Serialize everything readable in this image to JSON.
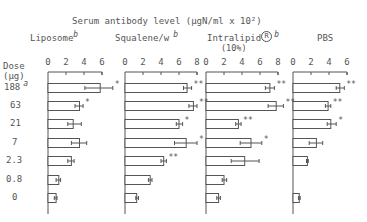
{
  "chart_data": {
    "type": "bar",
    "orientation": "horizontal",
    "title": "Serum antibody level (µgN/ml x 10²)",
    "ylabel": "Dose (µg)",
    "categories": [
      "188",
      "63",
      "21",
      "7",
      "2.3",
      "0.8",
      "0"
    ],
    "category_footnote": {
      "188": "a"
    },
    "error_bars": true,
    "grid": false,
    "panels": [
      {
        "name": "Liposome",
        "footnote": "b",
        "xlim": [
          0,
          6
        ],
        "ticks": [
          0,
          2,
          4,
          6
        ],
        "values": [
          5.8,
          3.5,
          2.8,
          3.5,
          2.6,
          1.2,
          0.9
        ],
        "err_low": [
          4.1,
          3.0,
          2.2,
          2.6,
          2.2,
          0.9,
          0.7
        ],
        "err_high": [
          7.2,
          3.9,
          3.7,
          4.3,
          2.9,
          1.4,
          1.0
        ],
        "significance": [
          "*",
          "*",
          "",
          "",
          "",
          "",
          ""
        ]
      },
      {
        "name": "Squalene/w",
        "footnote": "b",
        "xlim": [
          0,
          8
        ],
        "ticks": [
          0,
          2,
          4,
          6,
          8
        ],
        "values": [
          6.9,
          7.6,
          6.0,
          6.8,
          4.3,
          2.8,
          1.3
        ],
        "err_low": [
          6.5,
          7.1,
          5.7,
          5.5,
          4.0,
          2.6,
          1.2
        ],
        "err_high": [
          7.4,
          8.0,
          6.4,
          8.0,
          4.6,
          3.0,
          1.5
        ],
        "significance": [
          "**",
          "**",
          "*",
          "*",
          "**",
          "",
          ""
        ]
      },
      {
        "name": "Intralipid (10%)",
        "footnote": "b",
        "registered": true,
        "xlim": [
          0,
          8
        ],
        "ticks": [
          0,
          2,
          4,
          6,
          8
        ],
        "values": [
          7.1,
          7.8,
          3.6,
          5.0,
          4.3,
          2.0,
          1.4
        ],
        "err_low": [
          6.6,
          6.9,
          3.3,
          3.8,
          2.8,
          1.8,
          1.2
        ],
        "err_high": [
          7.6,
          8.6,
          3.9,
          6.2,
          5.9,
          2.3,
          1.6
        ],
        "significance": [
          "**",
          "**",
          "**",
          "*",
          "",
          "",
          ""
        ]
      },
      {
        "name": "PBS",
        "footnote": "",
        "xlim": [
          0,
          6
        ],
        "ticks": [
          0,
          2,
          4,
          6
        ],
        "values": [
          5.2,
          3.9,
          4.2,
          2.6,
          1.6,
          0,
          0.7
        ],
        "err_low": [
          4.8,
          3.6,
          3.8,
          1.8,
          1.5,
          0,
          0.6
        ],
        "err_high": [
          5.7,
          4.2,
          4.8,
          3.3,
          1.7,
          0,
          0.8
        ],
        "significance": [
          "**",
          "**",
          "*",
          "",
          "",
          "",
          ""
        ]
      }
    ]
  },
  "labels": {
    "title": "Serum antibody level (µgN/ml x 10²)",
    "dose_label": "Dose",
    "dose_unit": "(µg)",
    "dose_footnote": "a",
    "panel_titles": [
      {
        "name": "Liposome",
        "sup": "b"
      },
      {
        "name": "Squalene/w",
        "sup": "b"
      },
      {
        "name": "Intralipid",
        "reg": "R",
        "sup": "b",
        "sub": "(10%)"
      },
      {
        "name": "PBS",
        "sup": ""
      }
    ]
  },
  "colors": {
    "ink": "#555555",
    "background": "#ffffff"
  }
}
